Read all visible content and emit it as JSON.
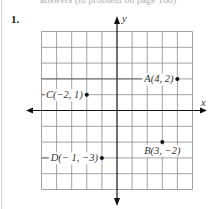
{
  "header": {
    "partial_text": "answers  (to problem on page 168)"
  },
  "problem": {
    "number": "1."
  },
  "plot": {
    "x_axis_label": "x",
    "y_axis_label": "y",
    "x_range": [
      -5,
      5
    ],
    "y_range": [
      -5,
      5
    ],
    "grid_step": 1,
    "grid_color": "#8a8a8a",
    "axis_color": "#111111",
    "points": [
      {
        "name": "A",
        "x": 4,
        "y": 2,
        "label": "A(4, 2)",
        "label_position": "left"
      },
      {
        "name": "B",
        "x": 3,
        "y": -2,
        "label": "B(3, −2)",
        "label_position": "below"
      },
      {
        "name": "C",
        "x": -2,
        "y": 1,
        "label": "C(−2, 1)",
        "label_position": "left"
      },
      {
        "name": "D",
        "x": -1,
        "y": -3,
        "label": "D(− 1, −3)",
        "label_position": "left"
      }
    ]
  }
}
